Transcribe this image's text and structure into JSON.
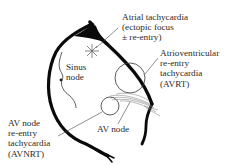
{
  "diagram": {
    "colors": {
      "outline": "#0a0a0a",
      "text": "#2a2a2a",
      "leader": "#444444",
      "background": "#ffffff"
    },
    "labels": {
      "sinus_node": [
        "Sinus",
        "node"
      ],
      "atrial_tachycardia": [
        "Atrial tachycardia",
        "(ectopic focus",
        "± re-entry)"
      ],
      "avrt": [
        "Atrioventricular",
        "re-entry",
        "tachycardia",
        "(AVRT)"
      ],
      "avnrt": [
        "AV node",
        "re-entry",
        "tachycardia",
        "(AVNRT)"
      ],
      "av_node": "AV node"
    },
    "icons": {
      "ectopic_focus": "asterisk-burst-icon",
      "avrt_circuit": "circle-loop-icon",
      "avnrt_circuit": "circle-loop-icon"
    }
  }
}
